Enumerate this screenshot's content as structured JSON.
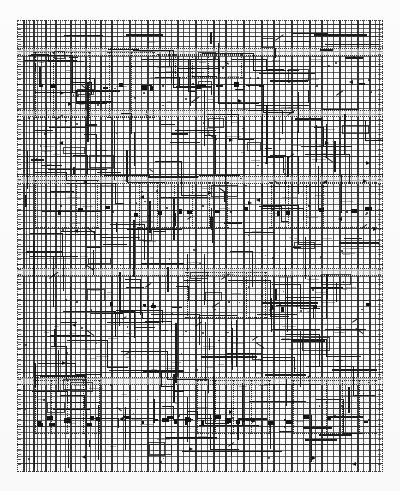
{
  "document": {
    "kind": "technical-schematic",
    "subtype": "wiring-diagram",
    "title": "",
    "caption": "",
    "page_background": "#ffffff",
    "ink_color": "#1c1c1c",
    "paper_color": "#fdfdfd",
    "frame_style": "dotted",
    "render_quality": "low-resolution scan",
    "content_bounds": {
      "x": 17,
      "y": 20,
      "width": 366,
      "height": 452
    }
  },
  "chart_data": {
    "type": "table",
    "title": "",
    "xlabel": "",
    "ylabel": "",
    "axis_ranges": {
      "x": [
        0,
        366
      ],
      "y": [
        0,
        452
      ]
    },
    "grid": true,
    "legend": "none",
    "vertical_bus_x": [
      6,
      9,
      12,
      16,
      20,
      24,
      28,
      33,
      38,
      43,
      48,
      53,
      58,
      63,
      68,
      73,
      78,
      83,
      88,
      94,
      100,
      106,
      112,
      118,
      124,
      130,
      136,
      142,
      148,
      154,
      160,
      166,
      172,
      178,
      184,
      190,
      196,
      202,
      208,
      214,
      220,
      226,
      232,
      238,
      244,
      250,
      256,
      262,
      268,
      274,
      280,
      286,
      292,
      298,
      304,
      310,
      316,
      322,
      328,
      334,
      340,
      346,
      352,
      358,
      362
    ],
    "vertical_bus_weight": [
      2,
      1,
      1,
      2,
      1,
      1,
      2,
      1,
      2,
      1,
      1,
      2,
      1,
      1,
      2,
      1,
      1,
      2,
      1,
      2,
      1,
      1,
      2,
      1,
      1,
      2,
      1,
      2,
      1,
      1,
      2,
      1,
      1,
      2,
      1,
      1,
      2,
      1,
      2,
      1,
      1,
      2,
      1,
      1,
      2,
      1,
      2,
      1,
      1,
      2,
      1,
      1,
      2,
      1,
      2,
      1,
      1,
      2,
      1,
      1,
      2,
      1,
      2,
      1,
      1
    ],
    "horizontal_rail_y": [
      4,
      8,
      12,
      16,
      21,
      26,
      31,
      36,
      41,
      46,
      52,
      58,
      64,
      70,
      76,
      82,
      88,
      94,
      100,
      106,
      112,
      118,
      124,
      130,
      136,
      142,
      148,
      154,
      160,
      166,
      172,
      178,
      184,
      190,
      196,
      202,
      208,
      214,
      220,
      226,
      232,
      238,
      244,
      250,
      256,
      262,
      268,
      274,
      280,
      286,
      292,
      298,
      304,
      310,
      316,
      322,
      328,
      334,
      340,
      346,
      352,
      358,
      364,
      370,
      376,
      382,
      388,
      394,
      400,
      406,
      412,
      418,
      424,
      430,
      436,
      443
    ],
    "module_bands": [
      {
        "name": "band-upper-1",
        "y": 28,
        "height": 6
      },
      {
        "name": "band-upper-2",
        "y": 90,
        "height": 5
      },
      {
        "name": "band-mid-1",
        "y": 156,
        "height": 6
      },
      {
        "name": "band-mid-2",
        "y": 248,
        "height": 6
      },
      {
        "name": "band-lower-1",
        "y": 357,
        "height": 6
      }
    ],
    "component_clusters": [
      {
        "name": "cluster-top-left",
        "x": 14,
        "y": 30,
        "width": 62,
        "height": 70
      },
      {
        "name": "cluster-top-center",
        "x": 88,
        "y": 30,
        "width": 52,
        "height": 70
      },
      {
        "name": "cluster-top-right",
        "x": 138,
        "y": 32,
        "width": 90,
        "height": 28
      },
      {
        "name": "cluster-mid-left",
        "x": 14,
        "y": 158,
        "width": 70,
        "height": 52
      },
      {
        "name": "cluster-mid-center",
        "x": 118,
        "y": 160,
        "width": 96,
        "height": 50
      },
      {
        "name": "cluster-mid-right",
        "x": 250,
        "y": 160,
        "width": 112,
        "height": 50
      },
      {
        "name": "cluster-low-mid",
        "x": 166,
        "y": 250,
        "width": 86,
        "height": 50
      },
      {
        "name": "cluster-bottom-left",
        "x": 14,
        "y": 358,
        "width": 72,
        "height": 58
      },
      {
        "name": "cluster-bottom-center",
        "x": 176,
        "y": 358,
        "width": 80,
        "height": 58
      },
      {
        "name": "cluster-bottom-right",
        "x": 272,
        "y": 358,
        "width": 90,
        "height": 58
      }
    ],
    "junction_nodes": [
      {
        "x": 61,
        "y": 76
      },
      {
        "x": 118,
        "y": 78
      },
      {
        "x": 146,
        "y": 66
      },
      {
        "x": 176,
        "y": 64
      },
      {
        "x": 206,
        "y": 48
      },
      {
        "x": 232,
        "y": 66
      },
      {
        "x": 272,
        "y": 62
      },
      {
        "x": 300,
        "y": 66
      },
      {
        "x": 44,
        "y": 186
      },
      {
        "x": 96,
        "y": 192
      },
      {
        "x": 150,
        "y": 188
      },
      {
        "x": 186,
        "y": 186
      },
      {
        "x": 214,
        "y": 192
      },
      {
        "x": 256,
        "y": 190
      },
      {
        "x": 292,
        "y": 186
      },
      {
        "x": 330,
        "y": 192
      },
      {
        "x": 60,
        "y": 282
      },
      {
        "x": 136,
        "y": 284
      },
      {
        "x": 212,
        "y": 282
      },
      {
        "x": 280,
        "y": 286
      },
      {
        "x": 52,
        "y": 398
      },
      {
        "x": 108,
        "y": 400
      },
      {
        "x": 162,
        "y": 396
      },
      {
        "x": 216,
        "y": 398
      },
      {
        "x": 268,
        "y": 400
      },
      {
        "x": 318,
        "y": 396
      },
      {
        "x": 352,
        "y": 400
      }
    ]
  },
  "annotations": {
    "legible_text": "none — text is below scan resolution",
    "symbol_types": [
      "junction-dot",
      "connector-block",
      "ground-symbol",
      "diode-arrow",
      "splice-node",
      "shielded-run"
    ]
  },
  "colors": {
    "ink": "#1c1c1c",
    "ink_light": "#3a3a3a",
    "paper": "#fdfdfd",
    "band_fill": "#ebebeb",
    "page": "#ffffff"
  }
}
